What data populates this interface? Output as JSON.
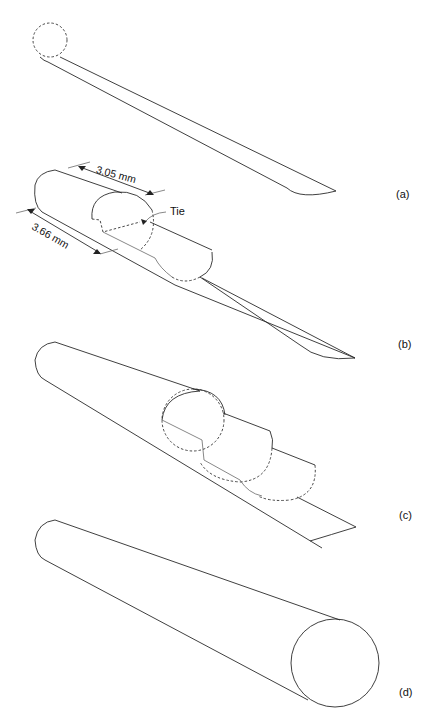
{
  "figure": {
    "panels": [
      {
        "id": "a",
        "label": "(a)",
        "description": "Flat strip with dashed circular end outline"
      },
      {
        "id": "b",
        "label": "(b)",
        "description": "Strip partially rolled into a cylinder with tie"
      },
      {
        "id": "c",
        "label": "(c)",
        "description": "Strip further rolled along a tapered cylinder"
      },
      {
        "id": "d",
        "label": "(d)",
        "description": "Fully rolled tapered cylinder"
      }
    ],
    "annotations": {
      "length_top": "3.05 mm",
      "length_bottom": "3.66 mm",
      "tie": "Tie"
    }
  }
}
